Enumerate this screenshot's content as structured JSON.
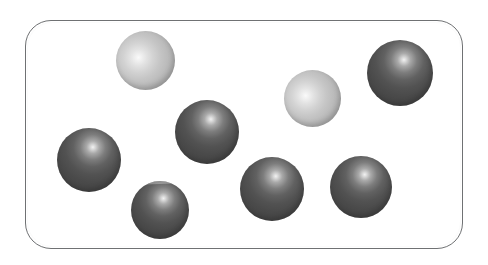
{
  "figure": {
    "background_color": "#ffffff"
  },
  "container": {
    "name": "vessel",
    "shape": "rounded-rectangle",
    "border_color": "#6f7173",
    "fill_color": "#ffffff",
    "x": 25,
    "y": 20,
    "width": 438,
    "height": 229,
    "corner_radius": 26
  },
  "legend": {
    "light_label": "light sphere",
    "dark_label": "dark sphere",
    "light_color": "#bcbcbc",
    "dark_color": "#4a4a4a"
  },
  "counts": {
    "total": 8,
    "light": 2,
    "dark": 6
  },
  "spheres": [
    {
      "id": "sphere-1",
      "shade": "light",
      "x": 116,
      "y": 31,
      "diameter": 59,
      "highlight": "upper-left"
    },
    {
      "id": "sphere-2",
      "shade": "dark",
      "x": 367,
      "y": 40,
      "diameter": 66,
      "highlight": "upper-center"
    },
    {
      "id": "sphere-3",
      "shade": "light",
      "x": 284,
      "y": 70,
      "diameter": 57,
      "highlight": "center-left"
    },
    {
      "id": "sphere-4",
      "shade": "dark",
      "x": 175,
      "y": 100,
      "diameter": 64,
      "highlight": "upper-center"
    },
    {
      "id": "sphere-5",
      "shade": "dark",
      "x": 57,
      "y": 128,
      "diameter": 64,
      "highlight": "upper-center"
    },
    {
      "id": "sphere-6",
      "shade": "dark",
      "x": 131,
      "y": 181,
      "diameter": 58,
      "highlight": "upper-center",
      "artifact": "scan-band"
    },
    {
      "id": "sphere-7",
      "shade": "dark",
      "x": 240,
      "y": 157,
      "diameter": 64,
      "highlight": "upper-center"
    },
    {
      "id": "sphere-8",
      "shade": "dark",
      "x": 330,
      "y": 156,
      "diameter": 62,
      "highlight": "upper-center"
    }
  ]
}
